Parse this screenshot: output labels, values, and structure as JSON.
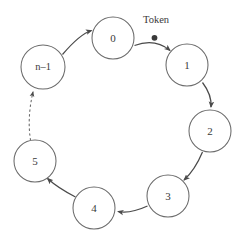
{
  "diagram": {
    "type": "token-ring-network",
    "background_color": "#ffffff",
    "stroke_color": "#4a4a4a",
    "node_stroke_color": "#6b6b6b",
    "text_color": "#3a3a3a",
    "annotation": {
      "label": "Token",
      "on_edge_from": "0",
      "on_edge_to": "1",
      "marker": "token-dot"
    },
    "nodes": [
      {
        "id": "node-0",
        "label": "0",
        "cx": 113,
        "cy": 38,
        "r": 21
      },
      {
        "id": "node-1",
        "label": "1",
        "cx": 187,
        "cy": 65,
        "r": 21
      },
      {
        "id": "node-2",
        "label": "2",
        "cx": 210,
        "cy": 131,
        "r": 21
      },
      {
        "id": "node-3",
        "label": "3",
        "cx": 168,
        "cy": 196,
        "r": 21
      },
      {
        "id": "node-4",
        "label": "4",
        "cx": 94,
        "cy": 208,
        "r": 21
      },
      {
        "id": "node-5",
        "label": "5",
        "cx": 35,
        "cy": 161,
        "r": 21
      },
      {
        "id": "node-n-1",
        "label": "n–1",
        "cx": 43,
        "cy": 67,
        "r": 22
      }
    ],
    "edges": [
      {
        "id": "edge-0-1",
        "from": "0",
        "to": "1",
        "style": "solid",
        "has_token": true
      },
      {
        "id": "edge-1-2",
        "from": "1",
        "to": "2",
        "style": "solid",
        "has_token": false
      },
      {
        "id": "edge-2-3",
        "from": "2",
        "to": "3",
        "style": "solid",
        "has_token": false
      },
      {
        "id": "edge-3-4",
        "from": "3",
        "to": "4",
        "style": "solid",
        "has_token": false
      },
      {
        "id": "edge-4-5",
        "from": "4",
        "to": "5",
        "style": "solid",
        "has_token": false
      },
      {
        "id": "edge-5-n-1",
        "from": "5",
        "to": "n–1",
        "style": "dashed",
        "has_token": false
      },
      {
        "id": "edge-n-1-0",
        "from": "n–1",
        "to": "0",
        "style": "solid",
        "has_token": false
      }
    ]
  }
}
